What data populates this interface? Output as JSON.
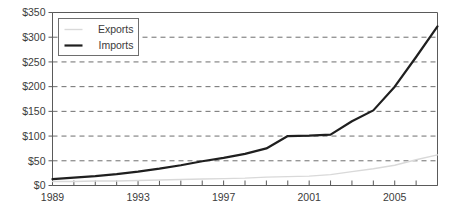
{
  "chart_data": {
    "type": "line",
    "title": "",
    "subtitle": "",
    "xlabel": "",
    "ylabel": "",
    "xlim": [
      1989,
      2007
    ],
    "ylim": [
      0,
      350
    ],
    "grid": "horizontal-dashed",
    "legend_position": "top-left-inside",
    "y_ticks": [
      0,
      50,
      100,
      150,
      200,
      250,
      300,
      350
    ],
    "y_tick_labels": [
      "$0",
      "$50",
      "$100",
      "$150",
      "$200",
      "$250",
      "$300",
      "$350"
    ],
    "x_ticks": [
      1989,
      1990,
      1991,
      1992,
      1993,
      1994,
      1995,
      1996,
      1997,
      1998,
      1999,
      2000,
      2001,
      2002,
      2003,
      2004,
      2005,
      2006,
      2007
    ],
    "x_tick_labels_shown": [
      "1989",
      "1993",
      "1997",
      "2001",
      "2005"
    ],
    "x_labeled_years": [
      1989,
      1993,
      1997,
      2001,
      2005
    ],
    "x": [
      1989,
      1990,
      1991,
      1992,
      1993,
      1994,
      1995,
      1996,
      1997,
      1998,
      1999,
      2000,
      2001,
      2002,
      2003,
      2004,
      2005,
      2006,
      2007
    ],
    "series": [
      {
        "name": "Exports",
        "color": "#d9d9d9",
        "line_width": 1.4,
        "values": [
          8,
          8,
          9,
          9,
          10,
          11,
          12,
          13,
          14,
          15,
          17,
          18,
          19,
          22,
          28,
          34,
          41,
          52,
          62
        ]
      },
      {
        "name": "Imports",
        "color": "#1f1f1f",
        "line_width": 2.2,
        "values": [
          13,
          16,
          19,
          23,
          28,
          34,
          41,
          49,
          56,
          64,
          75,
          100,
          101,
          103,
          130,
          152,
          200,
          260,
          322
        ]
      }
    ]
  },
  "legend": {
    "entries": [
      {
        "label": "Exports",
        "swatch_color": "#d9d9d9"
      },
      {
        "label": "Imports",
        "swatch_color": "#1f1f1f"
      }
    ]
  },
  "axis": {
    "y_labels": [
      "$350",
      "$300",
      "$250",
      "$200",
      "$150",
      "$100",
      "$50",
      "$0"
    ],
    "x_labels": [
      "1989",
      "1993",
      "1997",
      "2001",
      "2005"
    ]
  },
  "colors": {
    "exports": "#d9d9d9",
    "imports": "#1f1f1f",
    "grid": "#6e6e6e",
    "axis": "#5a5a5a",
    "text": "#3b3b3b",
    "background": "#ffffff"
  }
}
